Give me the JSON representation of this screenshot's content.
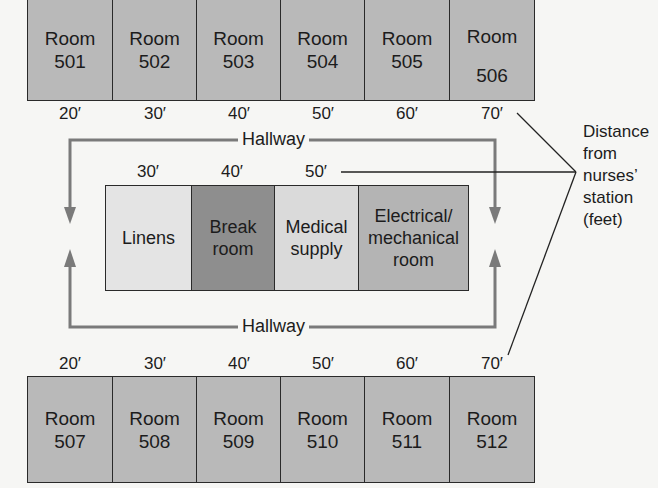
{
  "diagram": {
    "top_rooms": [
      {
        "label": "Room",
        "number": "501",
        "distance": "20′"
      },
      {
        "label": "Room",
        "number": "502",
        "distance": "30′"
      },
      {
        "label": "Room",
        "number": "503",
        "distance": "40′"
      },
      {
        "label": "Room",
        "number": "504",
        "distance": "50′"
      },
      {
        "label": "Room",
        "number": "505",
        "distance": "60′"
      },
      {
        "label": "Room",
        "number": "506",
        "distance": "70′"
      }
    ],
    "bottom_rooms": [
      {
        "label": "Room",
        "number": "507",
        "distance": "20′"
      },
      {
        "label": "Room",
        "number": "508",
        "distance": "30′"
      },
      {
        "label": "Room",
        "number": "509",
        "distance": "40′"
      },
      {
        "label": "Room",
        "number": "510",
        "distance": "50′"
      },
      {
        "label": "Room",
        "number": "511",
        "distance": "60′"
      },
      {
        "label": "Room",
        "number": "512",
        "distance": "70′"
      }
    ],
    "center_rooms": [
      {
        "line1": "Linens",
        "line2": "",
        "line3": "",
        "distance": "30′",
        "color": "#e4e4e4"
      },
      {
        "line1": "Break",
        "line2": "room",
        "line3": "",
        "distance": "40′",
        "color": "#8e8e8e"
      },
      {
        "line1": "Medical",
        "line2": "supply",
        "line3": "",
        "distance": "50′",
        "color": "#dadada"
      },
      {
        "line1": "Electrical/",
        "line2": "mechanical",
        "line3": "room",
        "distance": "",
        "color": "#b4b4b4"
      }
    ],
    "hallway_top_label": "Hallway",
    "hallway_bottom_label": "Hallway",
    "legend": {
      "line1": "Distance",
      "line2": "from",
      "line3": "nurses’",
      "line4": "station",
      "line5": "(feet)"
    },
    "colors": {
      "room_fill": "#b9b9b9",
      "hallway_line": "#7a7a7a",
      "border": "#2a2a2a"
    }
  }
}
